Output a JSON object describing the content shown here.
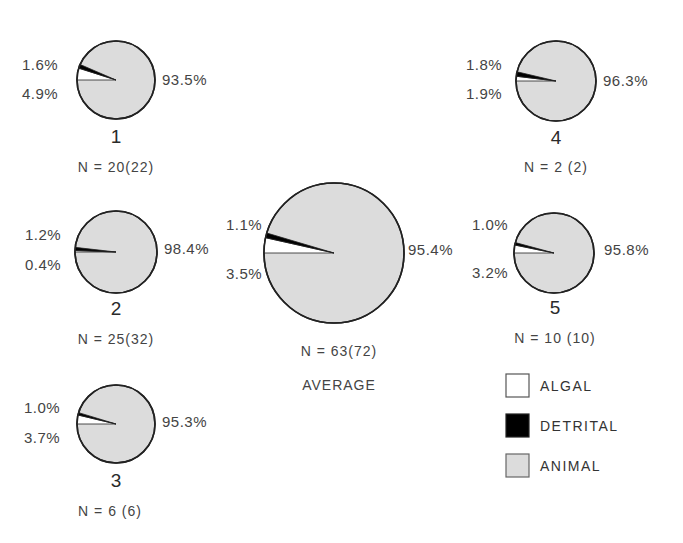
{
  "chart_data": {
    "type": "pie",
    "title": "",
    "legend": [
      {
        "label": "ALGAL",
        "color": "#ffffff"
      },
      {
        "label": "DETRITAL",
        "color": "#000000"
      },
      {
        "label": "ANIMAL",
        "color": "#dcdcdc"
      }
    ],
    "categories": [
      "ALGAL",
      "DETRITAL",
      "ANIMAL"
    ],
    "pies": [
      {
        "id": "1",
        "label": "1",
        "n_text": "N = 20(22)",
        "values": {
          "algal": 4.9,
          "detrital": 1.6,
          "animal": 93.5
        },
        "labels": {
          "algal": "4.9%",
          "detrital": "1.6%",
          "animal": "93.5%"
        }
      },
      {
        "id": "2",
        "label": "2",
        "n_text": "N = 25(32)",
        "values": {
          "algal": 0.4,
          "detrital": 1.2,
          "animal": 98.4
        },
        "labels": {
          "algal": "0.4%",
          "detrital": "1.2%",
          "animal": "98.4%"
        }
      },
      {
        "id": "3",
        "label": "3",
        "n_text": "N = 6 (6)",
        "values": {
          "algal": 3.7,
          "detrital": 1.0,
          "animal": 95.3
        },
        "labels": {
          "algal": "3.7%",
          "detrital": "1.0%",
          "animal": "95.3%"
        }
      },
      {
        "id": "4",
        "label": "4",
        "n_text": "N = 2 (2)",
        "values": {
          "algal": 1.9,
          "detrital": 1.8,
          "animal": 96.3
        },
        "labels": {
          "algal": "1.9%",
          "detrital": "1.8%",
          "animal": "96.3%"
        }
      },
      {
        "id": "5",
        "label": "5",
        "n_text": "N = 10 (10)",
        "values": {
          "algal": 3.2,
          "detrital": 1.0,
          "animal": 95.8
        },
        "labels": {
          "algal": "3.2%",
          "detrital": "1.0%",
          "animal": "95.8%"
        }
      },
      {
        "id": "average",
        "label": "AVERAGE",
        "n_text": "N = 63(72)",
        "values": {
          "algal": 3.5,
          "detrital": 1.1,
          "animal": 95.4
        },
        "labels": {
          "algal": "3.5%",
          "detrital": "1.1%",
          "animal": "95.4%"
        }
      }
    ]
  },
  "colors": {
    "algal": "#ffffff",
    "detrital": "#000000",
    "animal": "#dcdcdc",
    "stroke": "#222222"
  }
}
